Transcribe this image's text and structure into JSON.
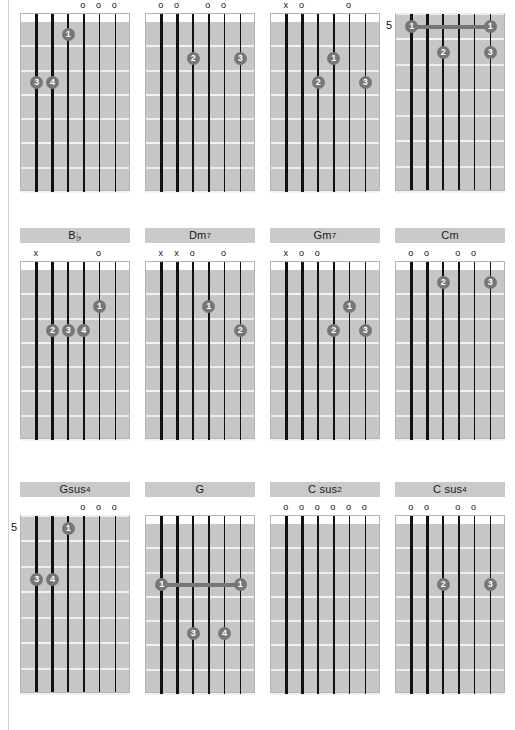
{
  "page": {
    "columns": 4,
    "rows": 3,
    "background_color": "#ffffff",
    "board_color": "#c6c6c6",
    "dot_color": "#767676",
    "label_bar_color": "#c9c9c9",
    "string_color": "#111111",
    "fret_color": "#f2f2f2",
    "open_symbol": "o",
    "mute_symbol": "x"
  },
  "chart_data": {
    "type": "table",
    "string_count": 6,
    "fret_count": 7,
    "diagrams": [
      {
        "id": "r1c1",
        "label": "",
        "label_sup": "",
        "start_fret": 1,
        "position_marker": "",
        "show_nut": true,
        "open_strings": [
          4,
          5,
          6
        ],
        "muted_strings": [],
        "dots": [
          {
            "string": 3,
            "fret": 1,
            "finger": "1"
          },
          {
            "string": 1,
            "fret": 3,
            "finger": "3"
          },
          {
            "string": 2,
            "fret": 3,
            "finger": "4"
          }
        ],
        "barres": []
      },
      {
        "id": "r1c2",
        "label": "",
        "label_sup": "",
        "start_fret": 1,
        "position_marker": "",
        "show_nut": true,
        "open_strings": [
          1,
          2,
          4,
          5
        ],
        "muted_strings": [],
        "dots": [
          {
            "string": 3,
            "fret": 2,
            "finger": "2"
          },
          {
            "string": 6,
            "fret": 2,
            "finger": "3"
          }
        ],
        "barres": []
      },
      {
        "id": "r1c3",
        "label": "",
        "label_sup": "",
        "start_fret": 1,
        "position_marker": "",
        "show_nut": true,
        "open_strings": [
          2,
          5
        ],
        "muted_strings": [
          1
        ],
        "dots": [
          {
            "string": 4,
            "fret": 2,
            "finger": "1"
          },
          {
            "string": 3,
            "fret": 3,
            "finger": "2"
          },
          {
            "string": 6,
            "fret": 3,
            "finger": "3"
          }
        ],
        "barres": []
      },
      {
        "id": "r1c4",
        "label": "",
        "label_sup": "",
        "start_fret": 5,
        "position_marker": "5",
        "show_nut": false,
        "open_strings": [],
        "muted_strings": [],
        "dots": [
          {
            "string": 1,
            "fret": 1,
            "finger": "1"
          },
          {
            "string": 6,
            "fret": 1,
            "finger": "1"
          },
          {
            "string": 3,
            "fret": 2,
            "finger": "2"
          },
          {
            "string": 6,
            "fret": 2,
            "finger": "3"
          }
        ],
        "barres": [
          {
            "fret": 1,
            "from_string": 1,
            "to_string": 6
          }
        ]
      },
      {
        "id": "r2c1",
        "label": "B",
        "label_sup": "",
        "label_flat": true,
        "start_fret": 1,
        "position_marker": "",
        "show_nut": true,
        "open_strings": [
          5
        ],
        "muted_strings": [
          1
        ],
        "dots": [
          {
            "string": 5,
            "fret": 2,
            "finger": "1"
          },
          {
            "string": 2,
            "fret": 3,
            "finger": "2"
          },
          {
            "string": 3,
            "fret": 3,
            "finger": "3"
          },
          {
            "string": 4,
            "fret": 3,
            "finger": "4"
          }
        ],
        "barres": []
      },
      {
        "id": "r2c2",
        "label": "Dm",
        "label_sup": "7",
        "start_fret": 1,
        "position_marker": "",
        "show_nut": true,
        "open_strings": [
          3,
          5
        ],
        "muted_strings": [
          1,
          2
        ],
        "dots": [
          {
            "string": 4,
            "fret": 2,
            "finger": "1"
          },
          {
            "string": 6,
            "fret": 3,
            "finger": "2"
          }
        ],
        "barres": []
      },
      {
        "id": "r2c3",
        "label": "Gm",
        "label_sup": "7",
        "start_fret": 1,
        "position_marker": "",
        "show_nut": true,
        "open_strings": [
          2,
          3
        ],
        "muted_strings": [
          1
        ],
        "dots": [
          {
            "string": 5,
            "fret": 2,
            "finger": "1"
          },
          {
            "string": 4,
            "fret": 3,
            "finger": "2"
          },
          {
            "string": 6,
            "fret": 3,
            "finger": "3"
          }
        ],
        "barres": []
      },
      {
        "id": "r2c4",
        "label": "Cm",
        "label_sup": "",
        "start_fret": 1,
        "position_marker": "",
        "show_nut": true,
        "open_strings": [
          1,
          2,
          4,
          5
        ],
        "muted_strings": [],
        "dots": [
          {
            "string": 3,
            "fret": 1,
            "finger": "2"
          },
          {
            "string": 6,
            "fret": 1,
            "finger": "3"
          }
        ],
        "barres": []
      },
      {
        "id": "r3c1",
        "label": "Gsus",
        "label_sup": "4",
        "start_fret": 5,
        "position_marker": "5",
        "show_nut": false,
        "open_strings": [
          4,
          5,
          6
        ],
        "muted_strings": [],
        "dots": [
          {
            "string": 3,
            "fret": 1,
            "finger": "1"
          },
          {
            "string": 1,
            "fret": 3,
            "finger": "3"
          },
          {
            "string": 2,
            "fret": 3,
            "finger": "4"
          }
        ],
        "barres": []
      },
      {
        "id": "r3c2",
        "label": "G",
        "label_sup": "",
        "start_fret": 1,
        "position_marker": "",
        "show_nut": true,
        "open_strings": [],
        "muted_strings": [],
        "dots": [
          {
            "string": 1,
            "fret": 3,
            "finger": "1"
          },
          {
            "string": 6,
            "fret": 3,
            "finger": "1"
          },
          {
            "string": 3,
            "fret": 5,
            "finger": "3"
          },
          {
            "string": 5,
            "fret": 5,
            "finger": "4"
          }
        ],
        "barres": [
          {
            "fret": 3,
            "from_string": 1,
            "to_string": 6
          }
        ]
      },
      {
        "id": "r3c3",
        "label": "C sus",
        "label_sup": "2",
        "start_fret": 1,
        "position_marker": "",
        "show_nut": true,
        "open_strings": [
          1,
          2,
          3,
          4,
          5,
          6
        ],
        "muted_strings": [],
        "dots": [],
        "barres": []
      },
      {
        "id": "r3c4",
        "label": "C sus",
        "label_sup": "4",
        "start_fret": 1,
        "position_marker": "",
        "show_nut": true,
        "open_strings": [
          1,
          2,
          4,
          5
        ],
        "muted_strings": [],
        "dots": [
          {
            "string": 3,
            "fret": 3,
            "finger": "2"
          },
          {
            "string": 6,
            "fret": 3,
            "finger": "3"
          }
        ],
        "barres": []
      }
    ]
  }
}
